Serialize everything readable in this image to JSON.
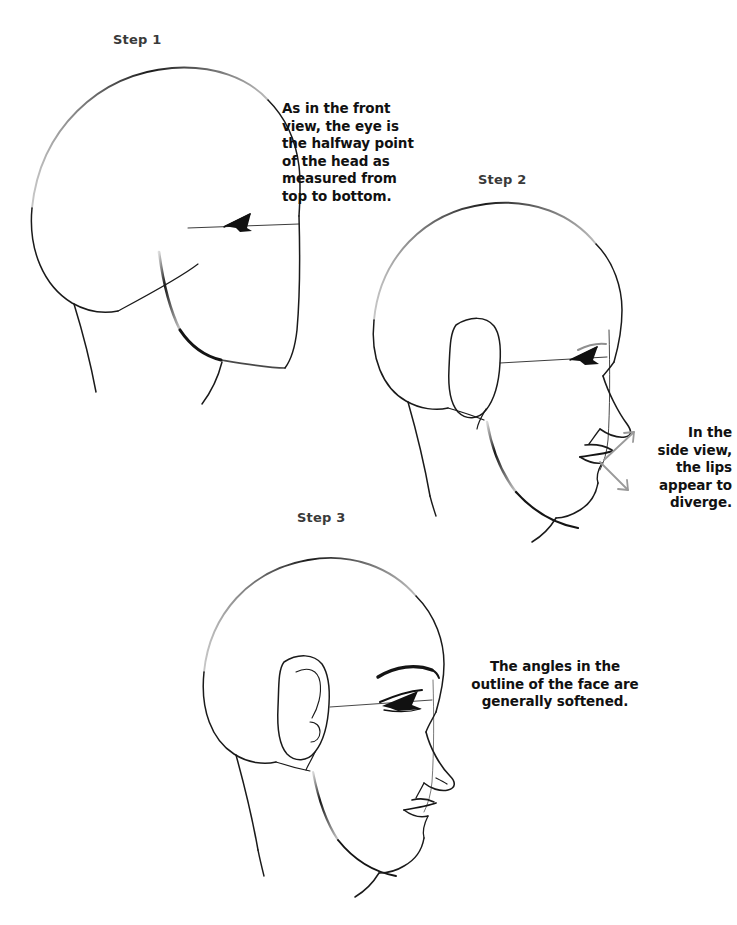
{
  "page": {
    "background_color": "#ffffff",
    "ink_color": "#1a1a1a",
    "arrow_color": "#9a9a9a",
    "label_color": "#3a3a3a",
    "text_color": "#111111"
  },
  "steps": [
    {
      "label": "Step 1",
      "name": "blocked-in-head"
    },
    {
      "label": "Step 2",
      "name": "head-with-features"
    },
    {
      "label": "Step 3",
      "name": "refined-head"
    }
  ],
  "captions": [
    {
      "id": "eye-halfway",
      "align": "left",
      "text": "As in the front\nview, the eye is\nthe halfway point\nof the head as\nmeasured from\ntop to bottom."
    },
    {
      "id": "lips-diverge",
      "align": "right",
      "text": "In the\nside view,\nthe lips\nappear to\ndiverge."
    },
    {
      "id": "angles-softened",
      "align": "center",
      "text": "The angles in the\noutline of the face are\ngenerally softened."
    }
  ],
  "annotations": {
    "arrows": [
      {
        "name": "lip-divergence-arrow-upper",
        "direction": "up-right",
        "color": "#9a9a9a"
      },
      {
        "name": "lip-divergence-arrow-lower",
        "direction": "down-right",
        "color": "#9a9a9a"
      }
    ]
  }
}
